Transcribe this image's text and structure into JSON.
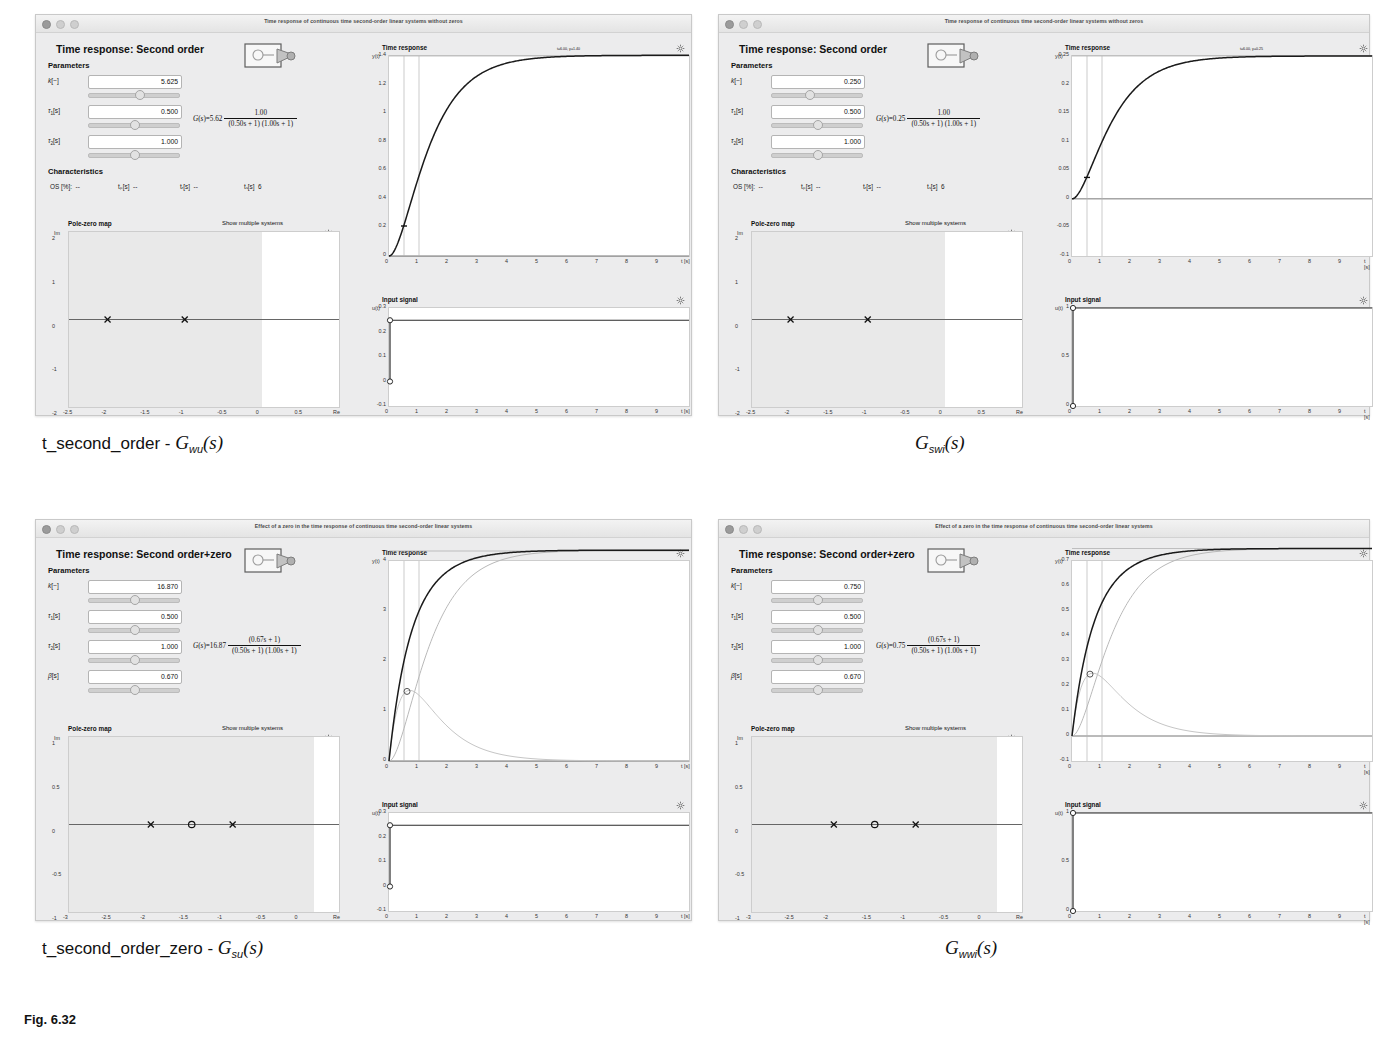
{
  "page": {
    "background": "#ffffff",
    "accent": "#000000"
  },
  "panels": [
    {
      "id": "panel-top-left",
      "window_title": "Time response of continuous time second-order linear systems without zeros",
      "heading": "Time response: Second order",
      "parameters_label": "Parameters",
      "characteristics_label": "Characteristics",
      "parameters": [
        {
          "symbol": "k",
          "unit": "[−]",
          "value": "5.625",
          "knob_pct": 56
        },
        {
          "symbol": "τ",
          "sub": "1",
          "unit": "[s]",
          "value": "0.500",
          "knob_pct": 50
        },
        {
          "symbol": "τ",
          "sub": "2",
          "unit": "[s]",
          "value": "1.000",
          "knob_pct": 50
        }
      ],
      "characteristics": [
        {
          "label": "OS [%]:",
          "value": "--"
        },
        {
          "label": "tₚ[s]",
          "value": "--"
        },
        {
          "label": "tᵣ[s]",
          "value": "--"
        },
        {
          "label": "tₛ[s]",
          "value": "6"
        }
      ],
      "transfer_function": {
        "lhs": "G(s)=5.62",
        "numerator": "1.00",
        "denominator": "(0.50s + 1) (1.00s + 1)"
      },
      "pole_zero": {
        "title": "Pole-zero map",
        "show_multiple_label": "Show multiple systems",
        "xlabel": "Re",
        "ylabel": "Im",
        "xticks": [
          "-2.5",
          "-2",
          "-1.5",
          "-1",
          "-0.5",
          "0",
          "0.5",
          "Re"
        ],
        "yticks": [
          "2",
          "1",
          "0",
          "-1",
          "-2"
        ],
        "poles": [
          -2,
          -1
        ],
        "zeros": []
      },
      "time_response": {
        "title": "Time response",
        "ylabel": "y(t)",
        "xlabel": "t [s]",
        "yticks": [
          "1.4",
          "1.2",
          "1",
          "0.8",
          "0.6",
          "0.4",
          "0.2",
          "0"
        ],
        "xticks": [
          "0",
          "1",
          "2",
          "3",
          "4",
          "5",
          "6",
          "7",
          "8",
          "9",
          "t [s]"
        ],
        "annotation": "t=6.00, y=1.40",
        "steady_state": 1.4
      },
      "input_signal": {
        "title": "Input signal",
        "ylabel": "u(t)",
        "xlabel": "t [s]",
        "yticks": [
          "0.3",
          "0.2",
          "0.1",
          "0",
          "-0.1"
        ],
        "xticks": [
          "0",
          "1",
          "2",
          "3",
          "4",
          "5",
          "6",
          "7",
          "8",
          "9",
          "t [s]"
        ],
        "step_value": 0.25
      },
      "caption": {
        "name": "t_second_order - ",
        "symbol": "G",
        "sub": "wu",
        "arg": "(s)"
      }
    },
    {
      "id": "panel-top-right",
      "window_title": "Time response of continuous time second-order linear systems without zeros",
      "heading": "Time response: Second order",
      "parameters_label": "Parameters",
      "characteristics_label": "Characteristics",
      "parameters": [
        {
          "symbol": "k",
          "unit": "[−]",
          "value": "0.250",
          "knob_pct": 40
        },
        {
          "symbol": "τ",
          "sub": "1",
          "unit": "[s]",
          "value": "0.500",
          "knob_pct": 50
        },
        {
          "symbol": "τ",
          "sub": "2",
          "unit": "[s]",
          "value": "1.000",
          "knob_pct": 50
        }
      ],
      "characteristics": [
        {
          "label": "OS [%]:",
          "value": "--"
        },
        {
          "label": "tₚ[s]",
          "value": "--"
        },
        {
          "label": "tᵣ[s]",
          "value": "--"
        },
        {
          "label": "tₛ[s]",
          "value": "6"
        }
      ],
      "transfer_function": {
        "lhs": "G(s)=0.25",
        "numerator": "1.00",
        "denominator": "(0.50s + 1) (1.00s + 1)"
      },
      "pole_zero": {
        "title": "Pole-zero map",
        "show_multiple_label": "Show multiple systems",
        "xlabel": "Re",
        "ylabel": "Im",
        "xticks": [
          "-2.5",
          "-2",
          "-1.5",
          "-1",
          "-0.5",
          "0",
          "0.5",
          "Re"
        ],
        "yticks": [
          "2",
          "1",
          "0",
          "-1",
          "-2"
        ],
        "poles": [
          -2,
          -1
        ],
        "zeros": []
      },
      "time_response": {
        "title": "Time response",
        "ylabel": "y(t)",
        "xlabel": "t [s]",
        "yticks": [
          "0.25",
          "0.2",
          "0.15",
          "0.1",
          "0.05",
          "0",
          "-0.05",
          "-0.1"
        ],
        "xticks": [
          "0",
          "1",
          "2",
          "3",
          "4",
          "5",
          "6",
          "7",
          "8",
          "9",
          "t [s]"
        ],
        "annotation": "t=6.00, y=0.25",
        "steady_state": 0.25
      },
      "input_signal": {
        "title": "Input signal",
        "ylabel": "u(t)",
        "xlabel": "t [s]",
        "yticks": [
          "1",
          "0.5",
          "0"
        ],
        "xticks": [
          "0",
          "1",
          "2",
          "3",
          "4",
          "5",
          "6",
          "7",
          "8",
          "9",
          "t [s]"
        ],
        "step_value": 1.0
      },
      "caption": {
        "name": "",
        "symbol": "G",
        "sub": "swi",
        "arg": "(s)"
      }
    },
    {
      "id": "panel-bottom-left",
      "window_title": "Effect of a zero in the time response of continuous time second-order linear systems",
      "heading": "Time response: Second order+zero",
      "parameters_label": "Parameters",
      "characteristics_label": "",
      "parameters": [
        {
          "symbol": "k",
          "unit": "[−]",
          "value": "16.870",
          "knob_pct": 50
        },
        {
          "symbol": "τ",
          "sub": "1",
          "unit": "[s]",
          "value": "0.500",
          "knob_pct": 50
        },
        {
          "symbol": "τ",
          "sub": "2",
          "unit": "[s]",
          "value": "1.000",
          "knob_pct": 50
        },
        {
          "symbol": "β",
          "unit": "[s]",
          "value": "0.670",
          "knob_pct": 50
        }
      ],
      "characteristics": [],
      "transfer_function": {
        "lhs": "G(s)=16.87",
        "numerator": "(0.67s + 1)",
        "denominator": "(0.50s + 1) (1.00s + 1)"
      },
      "pole_zero": {
        "title": "Pole-zero map",
        "show_multiple_label": "Show multiple systems",
        "xlabel": "Re",
        "ylabel": "Im",
        "xticks": [
          "-3",
          "-2.5",
          "-2",
          "-1.5",
          "-1",
          "-0.5",
          "0",
          "Re"
        ],
        "yticks": [
          "1",
          "0.5",
          "0",
          "-0.5",
          "-1"
        ],
        "poles": [
          -2,
          -1
        ],
        "zeros": [
          -1.5
        ]
      },
      "time_response": {
        "title": "Time response",
        "ylabel": "y(t)",
        "xlabel": "t [s]",
        "yticks": [
          "4",
          "3",
          "2",
          "1",
          "0"
        ],
        "xticks": [
          "0",
          "1",
          "2",
          "3",
          "4",
          "5",
          "6",
          "7",
          "8",
          "9",
          "t [s]"
        ],
        "annotation": "",
        "steady_state": 4.2
      },
      "input_signal": {
        "title": "Input signal",
        "ylabel": "u(t)",
        "xlabel": "t [s]",
        "yticks": [
          "0.3",
          "0.2",
          "0.1",
          "0",
          "-0.1"
        ],
        "xticks": [
          "0",
          "1",
          "2",
          "3",
          "4",
          "5",
          "6",
          "7",
          "8",
          "9",
          "t [s]"
        ],
        "step_value": 0.25
      },
      "caption": {
        "name": "t_second_order_zero - ",
        "symbol": "G",
        "sub": "su",
        "arg": "(s)"
      }
    },
    {
      "id": "panel-bottom-right",
      "window_title": "Effect of a zero in the time response of continuous time second-order linear systems",
      "heading": "Time response: Second order+zero",
      "parameters_label": "Parameters",
      "characteristics_label": "",
      "parameters": [
        {
          "symbol": "k",
          "unit": "[−]",
          "value": "0.750",
          "knob_pct": 50
        },
        {
          "symbol": "τ",
          "sub": "1",
          "unit": "[s]",
          "value": "0.500",
          "knob_pct": 50
        },
        {
          "symbol": "τ",
          "sub": "2",
          "unit": "[s]",
          "value": "1.000",
          "knob_pct": 50
        },
        {
          "symbol": "β",
          "unit": "[s]",
          "value": "0.670",
          "knob_pct": 50
        }
      ],
      "characteristics": [],
      "transfer_function": {
        "lhs": "G(s)=0.75",
        "numerator": "(0.67s + 1)",
        "denominator": "(0.50s + 1) (1.00s + 1)"
      },
      "pole_zero": {
        "title": "Pole-zero map",
        "show_multiple_label": "Show multiple systems",
        "xlabel": "Re",
        "ylabel": "Im",
        "xticks": [
          "-3",
          "-2.5",
          "-2",
          "-1.5",
          "-1",
          "-0.5",
          "0",
          "Re"
        ],
        "yticks": [
          "1",
          "0.5",
          "0",
          "-0.5",
          "-1"
        ],
        "poles": [
          -2,
          -1
        ],
        "zeros": [
          -1.5
        ]
      },
      "time_response": {
        "title": "Time response",
        "ylabel": "y(t)",
        "xlabel": "t [s]",
        "yticks": [
          "0.7",
          "0.6",
          "0.5",
          "0.4",
          "0.3",
          "0.2",
          "0.1",
          "0",
          "-0.1"
        ],
        "xticks": [
          "0",
          "1",
          "2",
          "3",
          "4",
          "5",
          "6",
          "7",
          "8",
          "9",
          "t [s]"
        ],
        "annotation": "",
        "steady_state": 0.75
      },
      "input_signal": {
        "title": "Input signal",
        "ylabel": "u(t)",
        "xlabel": "t [s]",
        "yticks": [
          "1",
          "0.5",
          "0"
        ],
        "xticks": [
          "0",
          "1",
          "2",
          "3",
          "4",
          "5",
          "6",
          "7",
          "8",
          "9",
          "t [s]"
        ],
        "step_value": 1.0
      },
      "caption": {
        "name": "",
        "symbol": "G",
        "sub": "wwi",
        "arg": "(s)"
      }
    }
  ],
  "figure_caption": "Fig. 6.32"
}
